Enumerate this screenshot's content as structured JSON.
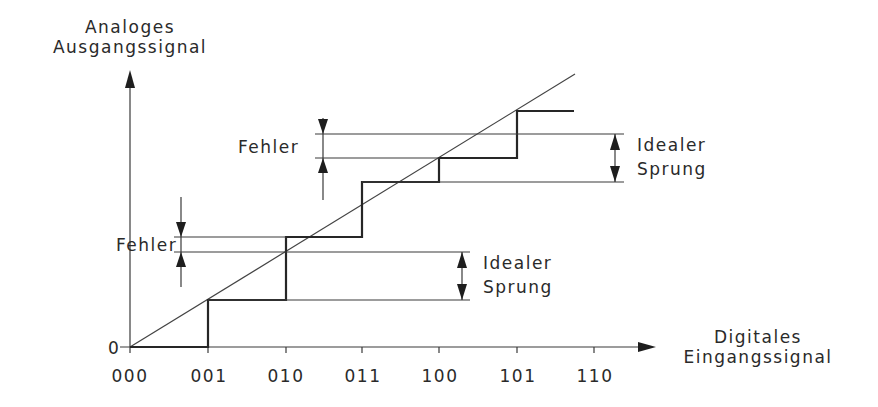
{
  "axes": {
    "y_label_line1": "Analoges",
    "y_label_line2": "Ausgangssignal",
    "x_label_line1": "Digitales",
    "x_label_line2": "Eingangssignal",
    "origin_label": "0",
    "x_ticks": [
      "000",
      "001",
      "010",
      "011",
      "100",
      "101",
      "110"
    ]
  },
  "annotations": {
    "lower_error": "Fehler",
    "upper_error": "Fehler",
    "lower_ideal_line1": "Idealer",
    "lower_ideal_line2": "Sprung",
    "upper_ideal_line1": "Idealer",
    "upper_ideal_line2": "Sprung"
  },
  "colors": {
    "line": "#262626",
    "text": "#2a2a2a",
    "background": "#ffffff"
  }
}
